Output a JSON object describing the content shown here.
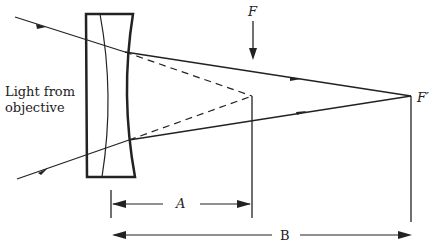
{
  "diagram": {
    "labels": {
      "light_line1": "Light from",
      "light_line2": "objective",
      "focus_original": "F",
      "focus_new": "F′",
      "dim_a": "A",
      "dim_b": "B"
    },
    "colors": {
      "stroke": "#222222",
      "background": "#ffffff"
    }
  }
}
